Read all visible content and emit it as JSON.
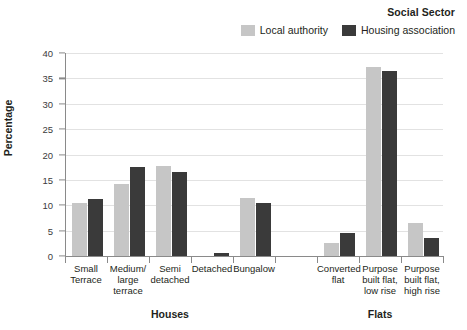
{
  "chart_data": {
    "type": "bar",
    "title": "Social Sector",
    "xlabel": "",
    "ylabel": "Percentage",
    "ylim": [
      0,
      40
    ],
    "yticks": [
      0,
      5,
      10,
      15,
      20,
      25,
      30,
      35,
      40
    ],
    "grid": true,
    "legend_position": "top-right",
    "categories": [
      "Small Terrace",
      "Medium/ large terrace",
      "Semi detached",
      "Detached",
      "Bungalow",
      "Converted flat",
      "Purpose built flat, low rise",
      "Purpose built flat, high rise"
    ],
    "category_lines": [
      [
        "Small",
        "Terrace"
      ],
      [
        "Medium/",
        "large",
        "terrace"
      ],
      [
        "Semi",
        "detached"
      ],
      [
        "Detached"
      ],
      [
        "Bungalow"
      ],
      [
        "Converted",
        "flat"
      ],
      [
        "Purpose",
        "built flat,",
        "low rise"
      ],
      [
        "Purpose",
        "built flat,",
        "high rise"
      ]
    ],
    "groups": [
      {
        "name": "Houses",
        "categories": [
          "Small Terrace",
          "Medium/ large terrace",
          "Semi detached",
          "Detached",
          "Bungalow"
        ]
      },
      {
        "name": "Flats",
        "categories": [
          "Converted flat",
          "Purpose built flat, low rise",
          "Purpose built flat, high rise"
        ]
      }
    ],
    "series": [
      {
        "name": "Local authority",
        "color": "#c6c6c6",
        "values": [
          10.4,
          14.2,
          17.8,
          0.0,
          11.5,
          2.5,
          37.3,
          6.5
        ]
      },
      {
        "name": "Housing association",
        "color": "#3a3a3a",
        "values": [
          11.3,
          17.5,
          16.6,
          0.6,
          10.5,
          4.6,
          36.4,
          3.5
        ]
      }
    ]
  },
  "axis": {
    "y_title": "Percentage",
    "tick_labels": [
      "0",
      "5",
      "10",
      "15",
      "20",
      "25",
      "30",
      "35",
      "40"
    ]
  },
  "legend": {
    "title": "Social Sector",
    "entries": [
      {
        "label": "Local authority",
        "color": "#c6c6c6"
      },
      {
        "label": "Housing association",
        "color": "#3a3a3a"
      }
    ]
  },
  "group_labels": [
    "Houses",
    "Flats"
  ]
}
